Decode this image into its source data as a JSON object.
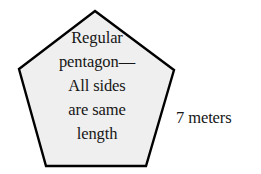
{
  "figure": {
    "type": "geometry-diagram",
    "shape": "regular-pentagon",
    "background_color": "#ffffff",
    "shape_fill_color": "#efefef",
    "shape_stroke_color": "#000000",
    "text_color": "#161616"
  },
  "pentagon": {
    "interior_text_lines": [
      "Regular",
      "pentagon—",
      "All sides",
      "are same",
      "length"
    ],
    "interior_text_full": "Regular pentagon—All sides are same length",
    "vertices": [
      {
        "name": "apex",
        "x": 95,
        "y": 11
      },
      {
        "name": "right",
        "x": 174,
        "y": 70
      },
      {
        "name": "bottom-right",
        "x": 146,
        "y": 166
      },
      {
        "name": "bottom-left",
        "x": 46,
        "y": 166
      },
      {
        "name": "left",
        "x": 19,
        "y": 69
      }
    ],
    "stroke_width": 2.4
  },
  "measurements": {
    "side_length_label": "7 meters",
    "side_length_value": 7,
    "side_length_unit": "meters",
    "labeled_edge": "right-to-bottom-right"
  }
}
